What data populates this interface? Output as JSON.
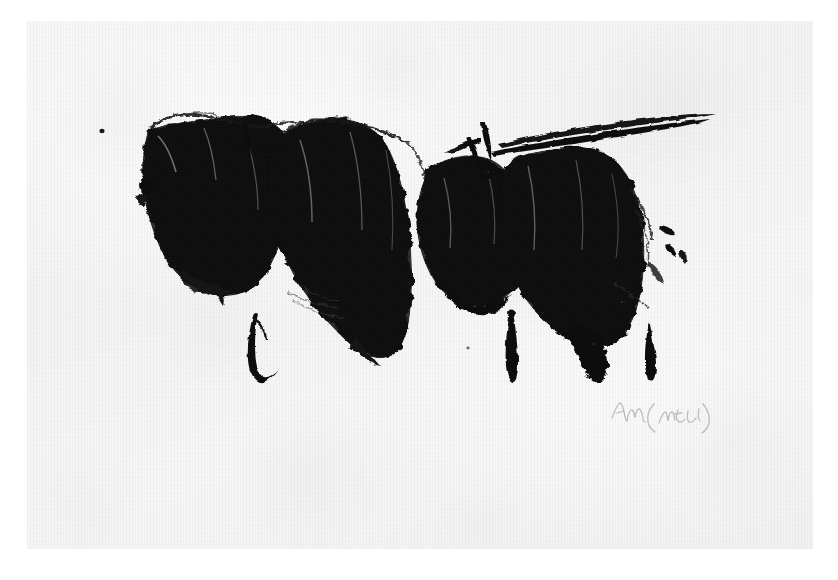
{
  "artwork": {
    "medium_description": "Black ink / brush on textured paper",
    "page": {
      "background_color": "#ffffff",
      "paper_color": "#f4f4f4",
      "paper_left": 27,
      "paper_top": 21,
      "paper_width": 786,
      "paper_height": 528
    },
    "ink": {
      "color": "#0d0d0d",
      "halftone_color": "#2b2b2b"
    },
    "composition": {
      "title": "Untitled ink composition",
      "mass_count": 4,
      "brush_stroke_count": 3,
      "diagonal_stroke_count": 2,
      "isolated_dot_count": 1,
      "ink_bounds": {
        "x": 118,
        "y": 104,
        "width": 612,
        "height": 278
      }
    },
    "signature": {
      "text": "Am (trial)",
      "type": "pencil-signature",
      "color": "#b9b9b9",
      "x": 606,
      "y": 392
    }
  }
}
